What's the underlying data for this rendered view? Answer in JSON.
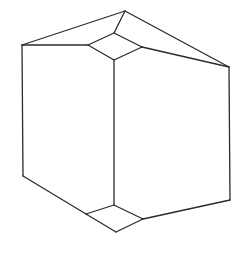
{
  "figure": {
    "name": "truncated-cube-line-drawing",
    "style": "line-art",
    "stroke_color": "#2b2b2b",
    "stroke_width": 1.3,
    "fill_color": "#ffffff",
    "background_color": "#ffffff",
    "canvas": {
      "width": 240,
      "height": 253
    },
    "vertices": {
      "apex_top": [
        125,
        11
      ],
      "left_top_corner": [
        22,
        45
      ],
      "right_top_corner": [
        229,
        67
      ],
      "left_bottom_corner": [
        23,
        176
      ],
      "right_bottom_corner": [
        230,
        200
      ],
      "center_top_of_vertical": [
        114,
        60
      ],
      "center_bottom_of_vertical": [
        114,
        205
      ],
      "top_facet_left": [
        88,
        45
      ],
      "top_facet_top": [
        114,
        33
      ],
      "top_facet_right": [
        142,
        47
      ],
      "top_facet_bottom": [
        114,
        60
      ],
      "bottom_facet_left": [
        86,
        214
      ],
      "bottom_facet_top": [
        114,
        205
      ],
      "bottom_facet_right": [
        143,
        219
      ],
      "bottom_facet_bottom": [
        116,
        232
      ]
    },
    "faces": [
      {
        "name": "top-small-quad-facet",
        "points": "88,45 114,33 142,47 114,60"
      },
      {
        "name": "bottom-small-quad-facet",
        "points": "86,214 114,205 143,219 116,232"
      },
      {
        "name": "upper-left-roof-face",
        "points": "22,45 125,11 114,33 88,45"
      },
      {
        "name": "upper-right-roof-face",
        "points": "125,11 229,67 142,47 114,60"
      },
      {
        "name": "left-front-face",
        "points": "22,45 88,45 114,60 114,205 86,214 23,176"
      },
      {
        "name": "right-front-face",
        "points": "114,60 142,47 229,67 230,200 143,219 114,205"
      }
    ],
    "edges": [
      {
        "name": "edge-apex-to-left-top",
        "d": "M125,11 L22,45"
      },
      {
        "name": "edge-apex-to-right-top",
        "d": "M125,11 L229,67"
      },
      {
        "name": "edge-apex-to-facet-top",
        "d": "M125,11 L114,33"
      },
      {
        "name": "edge-facet-top-to-facet-left",
        "d": "M114,33 L88,45"
      },
      {
        "name": "edge-facet-top-to-facet-right",
        "d": "M114,33 L142,47"
      },
      {
        "name": "edge-facet-left-to-facet-bottom",
        "d": "M88,45 L114,60"
      },
      {
        "name": "edge-facet-right-to-facet-bottom",
        "d": "M142,47 L114,60"
      },
      {
        "name": "edge-facet-left-to-left-top-corner",
        "d": "M88,45 L22,45"
      },
      {
        "name": "edge-facet-right-to-right-top-corner",
        "d": "M142,47 L229,67"
      },
      {
        "name": "edge-left-vertical",
        "d": "M22,45 L23,176"
      },
      {
        "name": "edge-right-vertical",
        "d": "M229,67 L230,200"
      },
      {
        "name": "edge-center-vertical",
        "d": "M114,60 L114,205"
      },
      {
        "name": "edge-left-bottom-diagonal",
        "d": "M23,176 L86,214"
      },
      {
        "name": "edge-right-bottom-diagonal",
        "d": "M230,200 L143,219"
      },
      {
        "name": "edge-bottom-facet-left-to-top",
        "d": "M86,214 L114,205"
      },
      {
        "name": "edge-bottom-facet-top-to-right",
        "d": "M114,205 L143,219"
      },
      {
        "name": "edge-bottom-facet-left-to-bottom",
        "d": "M86,214 L116,232"
      },
      {
        "name": "edge-bottom-facet-right-to-bottom",
        "d": "M143,219 L116,232"
      }
    ]
  }
}
